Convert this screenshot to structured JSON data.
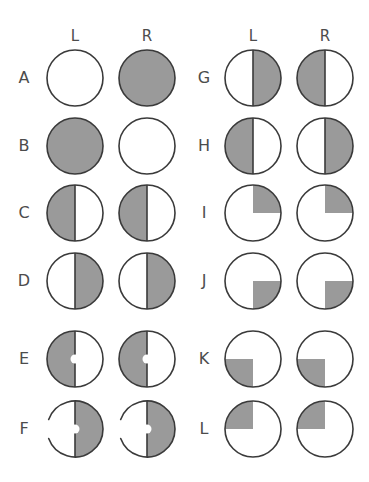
{
  "figure": {
    "title": "",
    "width": 369,
    "height": 482,
    "background_color": "#ffffff",
    "fill_color": "#9a9a9a",
    "empty_color": "#ffffff",
    "stroke_color": "#3a3a3a",
    "label_color": "#4c4c4c",
    "stroke_width": 1.6,
    "circle_radius": 28,
    "center_dot_radius": 4.5
  },
  "panels": [
    {
      "name": "left-panel",
      "column_headers": [
        "L",
        "R"
      ],
      "header_x": [
        75,
        147
      ],
      "header_y": 36,
      "label_x": 24,
      "circle_x": [
        75,
        147
      ],
      "rows": [
        {
          "label": "A",
          "y": 78,
          "cells": [
            {
              "side": "L",
              "state": "empty",
              "fill": "none",
              "divider": false,
              "center_dot": false,
              "broken_outline": false
            },
            {
              "side": "R",
              "state": "full",
              "fill": "all",
              "divider": false,
              "center_dot": false,
              "broken_outline": false
            }
          ]
        },
        {
          "label": "B",
          "y": 146,
          "cells": [
            {
              "side": "L",
              "state": "full",
              "fill": "all",
              "divider": false,
              "center_dot": false,
              "broken_outline": false
            },
            {
              "side": "R",
              "state": "empty",
              "fill": "none",
              "divider": false,
              "center_dot": false,
              "broken_outline": false
            }
          ]
        },
        {
          "label": "C",
          "y": 213,
          "cells": [
            {
              "side": "L",
              "state": "half",
              "fill": "left-half",
              "divider": true,
              "center_dot": false,
              "broken_outline": false
            },
            {
              "side": "R",
              "state": "half",
              "fill": "left-half",
              "divider": true,
              "center_dot": false,
              "broken_outline": false
            }
          ]
        },
        {
          "label": "D",
          "y": 281,
          "cells": [
            {
              "side": "L",
              "state": "half",
              "fill": "right-half",
              "divider": true,
              "center_dot": false,
              "broken_outline": false
            },
            {
              "side": "R",
              "state": "half",
              "fill": "right-half",
              "divider": true,
              "center_dot": false,
              "broken_outline": false
            }
          ]
        },
        {
          "label": "E",
          "y": 359,
          "cells": [
            {
              "side": "L",
              "state": "half-dot",
              "fill": "left-half",
              "divider": true,
              "center_dot": true,
              "broken_outline": false
            },
            {
              "side": "R",
              "state": "half-dot",
              "fill": "left-half",
              "divider": true,
              "center_dot": true,
              "broken_outline": false
            }
          ]
        },
        {
          "label": "F",
          "y": 429,
          "cells": [
            {
              "side": "L",
              "state": "half-dot-broken",
              "fill": "right-half",
              "divider": true,
              "center_dot": true,
              "broken_outline": true
            },
            {
              "side": "R",
              "state": "half-dot-broken",
              "fill": "right-half",
              "divider": true,
              "center_dot": true,
              "broken_outline": true
            }
          ]
        }
      ]
    },
    {
      "name": "right-panel",
      "column_headers": [
        "L",
        "R"
      ],
      "header_x": [
        253,
        325
      ],
      "header_y": 36,
      "label_x": 204,
      "circle_x": [
        253,
        325
      ],
      "rows": [
        {
          "label": "G",
          "y": 78,
          "cells": [
            {
              "side": "L",
              "state": "half",
              "fill": "right-half",
              "divider": true,
              "center_dot": false,
              "broken_outline": false
            },
            {
              "side": "R",
              "state": "half",
              "fill": "left-half",
              "divider": true,
              "center_dot": false,
              "broken_outline": false
            }
          ]
        },
        {
          "label": "H",
          "y": 146,
          "cells": [
            {
              "side": "L",
              "state": "half",
              "fill": "left-half",
              "divider": true,
              "center_dot": false,
              "broken_outline": false
            },
            {
              "side": "R",
              "state": "half",
              "fill": "right-half",
              "divider": true,
              "center_dot": false,
              "broken_outline": false
            }
          ]
        },
        {
          "label": "I",
          "y": 213,
          "cells": [
            {
              "side": "L",
              "state": "quadrant",
              "fill": "upper-right",
              "divider": false,
              "center_dot": false,
              "broken_outline": false
            },
            {
              "side": "R",
              "state": "quadrant",
              "fill": "upper-right",
              "divider": false,
              "center_dot": false,
              "broken_outline": false
            }
          ]
        },
        {
          "label": "J",
          "y": 281,
          "cells": [
            {
              "side": "L",
              "state": "quadrant",
              "fill": "lower-right",
              "divider": false,
              "center_dot": false,
              "broken_outline": false
            },
            {
              "side": "R",
              "state": "quadrant",
              "fill": "lower-right",
              "divider": false,
              "center_dot": false,
              "broken_outline": false
            }
          ]
        },
        {
          "label": "K",
          "y": 359,
          "cells": [
            {
              "side": "L",
              "state": "quadrant",
              "fill": "lower-left",
              "divider": false,
              "center_dot": false,
              "broken_outline": false
            },
            {
              "side": "R",
              "state": "quadrant",
              "fill": "lower-left",
              "divider": false,
              "center_dot": false,
              "broken_outline": false
            }
          ]
        },
        {
          "label": "L",
          "y": 429,
          "cells": [
            {
              "side": "L",
              "state": "quadrant",
              "fill": "upper-left",
              "divider": false,
              "center_dot": false,
              "broken_outline": false
            },
            {
              "side": "R",
              "state": "quadrant",
              "fill": "upper-left",
              "divider": false,
              "center_dot": false,
              "broken_outline": false
            }
          ]
        }
      ]
    }
  ]
}
